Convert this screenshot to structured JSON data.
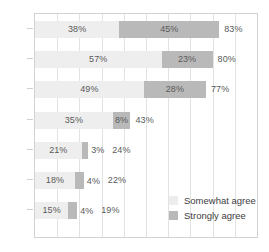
{
  "chart_data": {
    "type": "bar",
    "orientation": "horizontal",
    "stacked": true,
    "title": "",
    "subtitle": "",
    "xlabel": "",
    "ylabel": "",
    "xlim": [
      0,
      100
    ],
    "grid": true,
    "grid_step": 10,
    "legend_position": "bottom-right",
    "categories": [
      "",
      "",
      "",
      "",
      "",
      "",
      ""
    ],
    "series": [
      {
        "name": "Somewhat agree",
        "color": "#eeeeee",
        "values": [
          38,
          57,
          49,
          35,
          21,
          18,
          15
        ]
      },
      {
        "name": "Strongly agree",
        "color": "#b9b9b9",
        "values": [
          45,
          23,
          28,
          8,
          3,
          4,
          4
        ]
      }
    ],
    "totals": [
      83,
      80,
      77,
      43,
      24,
      22,
      19
    ],
    "rows": [
      {
        "somewhat": "38%",
        "strongly": "45%",
        "total": "83%",
        "somewhat_value": 38,
        "strongly_value": 45,
        "total_value": 83,
        "strongly_label_inside": true
      },
      {
        "somewhat": "57%",
        "strongly": "23%",
        "total": "80%",
        "somewhat_value": 57,
        "strongly_value": 23,
        "total_value": 80,
        "strongly_label_inside": true
      },
      {
        "somewhat": "49%",
        "strongly": "28%",
        "total": "77%",
        "somewhat_value": 49,
        "strongly_value": 28,
        "total_value": 77,
        "strongly_label_inside": true
      },
      {
        "somewhat": "35%",
        "strongly": "8%",
        "total": "43%",
        "somewhat_value": 35,
        "strongly_value": 8,
        "total_value": 43,
        "strongly_label_inside": true
      },
      {
        "somewhat": "21%",
        "strongly": "3%",
        "total": "24%",
        "somewhat_value": 21,
        "strongly_value": 3,
        "total_value": 24,
        "strongly_label_inside": false
      },
      {
        "somewhat": "18%",
        "strongly": "4%",
        "total": "22%",
        "somewhat_value": 18,
        "strongly_value": 4,
        "total_value": 22,
        "strongly_label_inside": false
      },
      {
        "somewhat": "15%",
        "strongly": "4%",
        "total": "19%",
        "somewhat_value": 15,
        "strongly_value": 4,
        "total_value": 19,
        "strongly_label_inside": false
      }
    ]
  },
  "legend": {
    "items": [
      {
        "label": "Somewhat agree",
        "color": "#ededed",
        "key": "somewhat"
      },
      {
        "label": "Strongly agree",
        "color": "#b9b9b9",
        "key": "strongly"
      }
    ]
  },
  "colors": {
    "somewhat_agree": "#eeeeee",
    "strongly_agree": "#b9b9b9",
    "gridline": "#e3e3e3",
    "border": "#d2d2d2",
    "label_text": "#5a5a5a",
    "legend_text": "#3d3d3d",
    "background": "#ffffff"
  }
}
